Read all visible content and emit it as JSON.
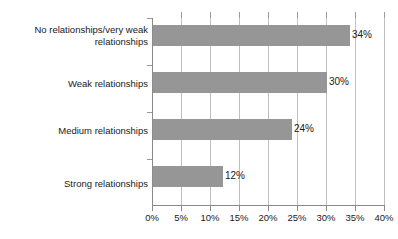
{
  "chart_data": {
    "type": "bar",
    "orientation": "horizontal",
    "title": "",
    "subtitle": "",
    "xlabel": "",
    "ylabel": "",
    "categories": [
      "No relationships/very weak relationships",
      "Weak relationships",
      "Medium relationships",
      "Strong relationships"
    ],
    "values": [
      34,
      30,
      24,
      12
    ],
    "value_labels": [
      "34%",
      "30%",
      "24%",
      "12%"
    ],
    "xlim": [
      0,
      40
    ],
    "xtick_values": [
      0,
      5,
      10,
      15,
      20,
      25,
      30,
      35,
      40
    ],
    "xtick_labels": [
      "0%",
      "5%",
      "10%",
      "15%",
      "20%",
      "25%",
      "30%",
      "35%",
      "40%"
    ],
    "grid": "vertical",
    "legend": "none",
    "series": [
      {
        "name": "",
        "values": [
          34,
          30,
          24,
          12
        ],
        "color": "#969696"
      }
    ],
    "colors": {
      "bar": "#969696",
      "gridline": "#c0c0c0",
      "axis": "#8a8a8a",
      "text": "#1a1a1a",
      "background": "#ffffff"
    }
  },
  "category_label_lines": [
    [
      "No relationships/very weak",
      "relationships"
    ],
    [
      "Weak relationships"
    ],
    [
      "Medium relationships"
    ],
    [
      "Strong relationships"
    ]
  ]
}
